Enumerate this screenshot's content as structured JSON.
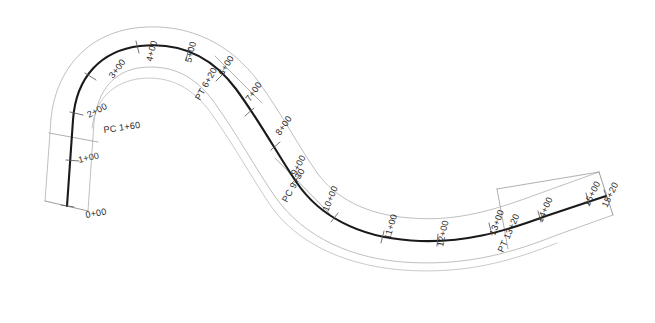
{
  "drawing": {
    "type": "roadway-horizontal-alignment-plan",
    "title": "Horizontal Alignment Plan",
    "background_color": "#ffffff",
    "centerline_color": "#1a1a1a",
    "row_color": "#b3b3b3",
    "offset_arc_color": "#bdbdbd",
    "label_color": "#2b2b2b",
    "begin_station": "0+00",
    "end_station": "15+20"
  },
  "curve_points": [
    {
      "name": "PC 1+60",
      "label": "PC 1+60",
      "station": "1+60",
      "kind": "point-of-curvature"
    },
    {
      "name": "PT 6+20",
      "label": "PT 6+20",
      "station": "6+20",
      "kind": "point-of-tangency"
    },
    {
      "name": "PC 9+30",
      "label": "PC 9+30",
      "station": "9+30",
      "kind": "point-of-curvature"
    },
    {
      "name": "PT 13+20",
      "label": "PT 13+20",
      "station": "13+20",
      "kind": "point-of-tangency"
    }
  ],
  "stations": [
    {
      "label": "0+00",
      "x": 86,
      "y": 218,
      "rot": -10,
      "anchor": "start"
    },
    {
      "label": "1+00",
      "x": 79,
      "y": 163,
      "rot": -13,
      "anchor": "start"
    },
    {
      "label": "2+00",
      "x": 89,
      "y": 118,
      "rot": -28,
      "anchor": "start"
    },
    {
      "label": "3+00",
      "x": 113,
      "y": 79,
      "rot": -52,
      "anchor": "start"
    },
    {
      "label": "4+00",
      "x": 152,
      "y": 62,
      "rot": -76,
      "anchor": "start"
    },
    {
      "label": "5+00",
      "x": 191,
      "y": 63,
      "rot": -76,
      "anchor": "start"
    },
    {
      "label": "6+00",
      "x": 223,
      "y": 76,
      "rot": -58,
      "anchor": "start"
    },
    {
      "label": "7+00",
      "x": 250,
      "y": 102,
      "rot": -55,
      "anchor": "start"
    },
    {
      "label": "8+00",
      "x": 280,
      "y": 136,
      "rot": -55,
      "anchor": "start"
    },
    {
      "label": "9+00",
      "x": 296,
      "y": 176,
      "rot": -62,
      "anchor": "start"
    },
    {
      "label": "10+00",
      "x": 328,
      "y": 212,
      "rot": -68,
      "anchor": "start"
    },
    {
      "label": "11+00",
      "x": 390,
      "y": 240,
      "rot": -74,
      "anchor": "start"
    },
    {
      "label": "12+00",
      "x": 443,
      "y": 247,
      "rot": -78,
      "anchor": "start"
    },
    {
      "label": "13+00",
      "x": 495,
      "y": 236,
      "rot": -70,
      "anchor": "start"
    },
    {
      "label": "14+00",
      "x": 542,
      "y": 223,
      "rot": -66,
      "anchor": "start"
    },
    {
      "label": "15+00",
      "x": 589,
      "y": 207,
      "rot": -64,
      "anchor": "start"
    },
    {
      "label": "15+20",
      "x": 607,
      "y": 208,
      "rot": -64,
      "anchor": "start"
    }
  ],
  "special_labels": [
    {
      "label": "PC 1+60",
      "x": 104,
      "y": 133,
      "rot": -8,
      "anchor": "start"
    },
    {
      "label": "PT 6+20",
      "x": 200,
      "y": 101,
      "rot": -61,
      "anchor": "start"
    },
    {
      "label": "PC 9+30",
      "x": 287,
      "y": 203,
      "rot": -61,
      "anchor": "start"
    },
    {
      "label": "PT 13+20",
      "x": 503,
      "y": 253,
      "rot": -66,
      "anchor": "start"
    }
  ],
  "geometry": {
    "centerline_path": "M 67,206 L 73,120 C 78,78 100,50 140,45 C 182,40 214,57 236,88 C 260,122 278,156 296,182 C 318,214 356,236 410,240 C 462,243 502,232 545,216 L 605,195",
    "row_left_path": "M 45,201 L 51,119 C 57,69 85,32 139,27 C 190,22 231,45 257,80 C 281,113 299,148 317,173 C 334,196 364,214 411,217 C 458,221 496,209 537,194 L 599,172",
    "row_right_path": "M 88,211 L 94,122 C 98,89 114,70 142,67 C 172,64 194,75 213,101 C 238,136 256,170 275,197 C 303,236 352,259 410,262 C 470,265 513,252 556,235 L 613,215",
    "offset_arc_path": "M 92,128 C 95,99 113,81 141,78 C 170,75 192,87 210,112 C 235,147 254,181 273,208 C 300,245 350,267 410,270 C 469,273 513,260 556,243",
    "end_cap_left": "M 45,201 L 88,211",
    "end_cap_right": "M 599,172 L 613,215"
  },
  "tick_marks": {
    "count": 17,
    "description": "perpendicular station tick marks across the centerline"
  }
}
